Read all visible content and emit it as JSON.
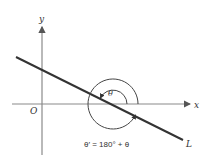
{
  "diagram": {
    "type": "angle-of-inclination",
    "axes": {
      "x_label": "x",
      "y_label": "y",
      "origin_label": "O"
    },
    "line": {
      "label": "L"
    },
    "angles": {
      "inner_label": "θ",
      "outer_label": "θ′ = 180° + θ"
    },
    "colors": {
      "axis": "#888888",
      "line": "#333333",
      "arc": "#444444",
      "text": "#333333"
    }
  }
}
